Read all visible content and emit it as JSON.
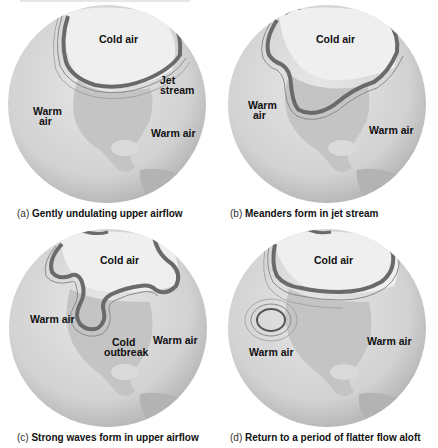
{
  "figure": {
    "panels": [
      {
        "id": "a",
        "tag": "(a)",
        "caption": "Gently undulating upper airflow",
        "labels": {
          "cold_air": "Cold air",
          "jet_stream_line1": "Jet",
          "jet_stream_line2": "stream",
          "warm_air_left_line1": "Warm",
          "warm_air_left_line2": "air",
          "warm_air_right": "Warm air"
        }
      },
      {
        "id": "b",
        "tag": "(b)",
        "caption": "Meanders form in jet stream",
        "labels": {
          "cold_air": "Cold air",
          "warm_air_left_line1": "Warm",
          "warm_air_left_line2": "air",
          "warm_air_right": "Warm air"
        }
      },
      {
        "id": "c",
        "tag": "(c)",
        "caption": "Strong waves form in upper airflow",
        "labels": {
          "cold_air": "Cold air",
          "warm_air_left": "Warm air",
          "warm_air_right": "Warm air",
          "cold_outbreak_line1": "Cold",
          "cold_outbreak_line2": "outbreak"
        }
      },
      {
        "id": "d",
        "tag": "(d)",
        "caption": "Return to a period of flatter flow aloft",
        "labels": {
          "cold_air": "Cold air",
          "warm_air_left": "Warm air",
          "warm_air_right": "Warm air"
        }
      }
    ],
    "colors": {
      "ocean": "#d9d9d9",
      "land": "#bdbdbd",
      "polar": "#eeeeee",
      "jet": "#555555",
      "text": "#111111"
    }
  }
}
